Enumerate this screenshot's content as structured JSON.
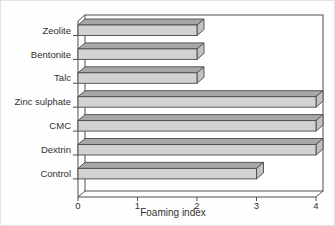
{
  "figure": {
    "type": "3d-horizontal-bar-chart"
  },
  "chart_data": {
    "type": "bar",
    "orientation": "horizontal",
    "style": "3d",
    "categories": [
      "Zeolite",
      "Bentonite",
      "Talc",
      "Zinc sulphate",
      "CMC",
      "Dextrin",
      "Control"
    ],
    "values": [
      2,
      2,
      2,
      4,
      4,
      4,
      3
    ],
    "title": "",
    "xlabel": "Foaming index",
    "ylabel": "",
    "xlim": [
      0,
      4
    ],
    "x_ticks": [
      "0",
      "1",
      "2",
      "3",
      "4"
    ],
    "grid": false,
    "legend": false,
    "colors": {
      "bar_front": "#d2d2d2",
      "bar_top": "#a7a7a7",
      "bar_side": "#c1c1c1",
      "outline": "#4a4a4a",
      "frame": "#4f4f4f",
      "text": "#303030",
      "wall_fill": "#ffffff",
      "background": "#fefefe"
    }
  }
}
